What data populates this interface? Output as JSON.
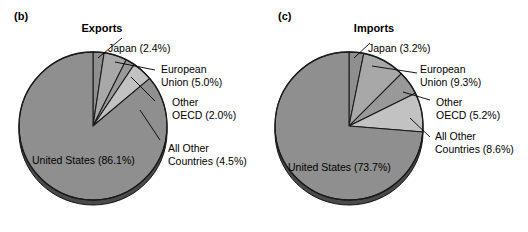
{
  "figure": {
    "background": "#ffffff",
    "text_color": "#000000"
  },
  "panels": [
    {
      "tag": "(b)",
      "title": "Exports",
      "labels": {
        "japan": "Japan (2.4%)",
        "eu_line1": "European",
        "eu_line2": "Union (5.0%)",
        "oecd_line1": "Other",
        "oecd_line2": "OECD (2.0%)",
        "other_line1": "All Other",
        "other_line2": "Countries (4.5%)",
        "us": "United States (86.1%)"
      }
    },
    {
      "tag": "(c)",
      "title": "Imports",
      "labels": {
        "japan": "Japan (3.2%)",
        "eu_line1": "European",
        "eu_line2": "Union (9.3%)",
        "oecd_line1": "Other",
        "oecd_line2": "OECD (5.2%)",
        "other_line1": "All Other",
        "other_line2": "Countries (8.6%)",
        "us": "United States (73.7%)"
      }
    }
  ],
  "chart_data": [
    {
      "type": "pie",
      "title": "Exports",
      "panel_tag": "(b)",
      "categories": [
        "Japan",
        "European Union",
        "Other OECD",
        "All Other Countries",
        "United States"
      ],
      "values": [
        2.4,
        5.0,
        2.0,
        4.5,
        86.1
      ],
      "value_unit": "percent",
      "start_angle_deg": 0,
      "direction": "clockwise",
      "slice_colors": [
        "#8f8f8f",
        "#a8a8a8",
        "#999999",
        "#c2c2c2",
        "#8f8f8f"
      ],
      "edge_color": "#1a1a1a",
      "legend": "labeled-with-leader-lines",
      "annotations": [
        "Japan (2.4%)",
        "European Union (5.0%)",
        "Other OECD (2.0%)",
        "All Other Countries (4.5%)",
        "United States (86.1%)"
      ]
    },
    {
      "type": "pie",
      "title": "Imports",
      "panel_tag": "(c)",
      "categories": [
        "Japan",
        "European Union",
        "Other OECD",
        "All Other Countries",
        "United States"
      ],
      "values": [
        3.2,
        9.3,
        5.2,
        8.6,
        73.7
      ],
      "value_unit": "percent",
      "start_angle_deg": 0,
      "direction": "clockwise",
      "slice_colors": [
        "#8f8f8f",
        "#a8a8a8",
        "#999999",
        "#c2c2c2",
        "#8f8f8f"
      ],
      "edge_color": "#1a1a1a",
      "legend": "labeled-with-leader-lines",
      "annotations": [
        "Japan (3.2%)",
        "European Union (9.3%)",
        "Other OECD (5.2%)",
        "All Other Countries (8.6%)",
        "United States (73.7%)"
      ]
    }
  ]
}
